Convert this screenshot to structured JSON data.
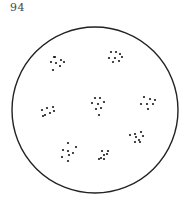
{
  "page": {
    "number": "94"
  },
  "figure": {
    "stroke_color": "#222222",
    "dot_color": "#1a1a1a",
    "clusters": [
      {
        "name": "upper-left",
        "dots": [
          [
            54,
            57
          ],
          [
            55,
            57
          ],
          [
            51,
            62
          ],
          [
            56,
            63
          ],
          [
            61,
            60
          ],
          [
            64,
            62
          ],
          [
            60,
            66
          ],
          [
            53,
            70
          ]
        ]
      },
      {
        "name": "upper-right",
        "dots": [
          [
            111,
            52
          ],
          [
            116,
            52
          ],
          [
            120,
            54
          ],
          [
            109,
            58
          ],
          [
            115,
            58
          ],
          [
            122,
            57
          ],
          [
            113,
            62
          ],
          [
            119,
            61
          ]
        ]
      },
      {
        "name": "middle-left",
        "dots": [
          [
            42,
            110
          ],
          [
            47,
            108
          ],
          [
            53,
            107
          ],
          [
            45,
            115
          ],
          [
            50,
            113
          ],
          [
            54,
            111
          ],
          [
            43,
            116
          ]
        ]
      },
      {
        "name": "center",
        "dots": [
          [
            95,
            98
          ],
          [
            100,
            98
          ],
          [
            92,
            103
          ],
          [
            98,
            104
          ],
          [
            104,
            102
          ],
          [
            96,
            109
          ],
          [
            101,
            108
          ],
          [
            99,
            115
          ]
        ]
      },
      {
        "name": "middle-right",
        "dots": [
          [
            144,
            97
          ],
          [
            150,
            99
          ],
          [
            155,
            100
          ],
          [
            141,
            104
          ],
          [
            147,
            104
          ],
          [
            153,
            104
          ],
          [
            148,
            109
          ]
        ]
      },
      {
        "name": "lower-right",
        "dots": [
          [
            135,
            134
          ],
          [
            141,
            132
          ],
          [
            143,
            136
          ],
          [
            130,
            135
          ],
          [
            136,
            137
          ],
          [
            139,
            140
          ],
          [
            135,
            142
          ],
          [
            140,
            142
          ]
        ]
      },
      {
        "name": "lower-left",
        "dots": [
          [
            68,
            143
          ],
          [
            76,
            147
          ],
          [
            63,
            150
          ],
          [
            68,
            151
          ],
          [
            73,
            153
          ],
          [
            62,
            157
          ],
          [
            69,
            155
          ],
          [
            68,
            161
          ]
        ]
      },
      {
        "name": "lower-center",
        "dots": [
          [
            102,
            151
          ],
          [
            108,
            151
          ],
          [
            104,
            155
          ],
          [
            107,
            154
          ],
          [
            101,
            158
          ],
          [
            99,
            159
          ],
          [
            104,
            159
          ]
        ]
      }
    ]
  }
}
